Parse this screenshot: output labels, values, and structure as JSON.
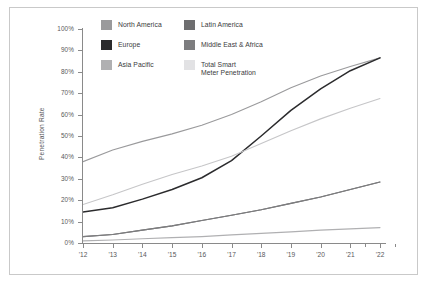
{
  "chart_data": {
    "type": "line",
    "title": "",
    "xlabel": "",
    "ylabel": "Penetration Rate",
    "categories": [
      "'12",
      "'13",
      "'14",
      "'15",
      "'16",
      "'17",
      "'18",
      "'19",
      "'20",
      "'21",
      "'22"
    ],
    "ylim": [
      0,
      100
    ],
    "ytick_labels": [
      "0%",
      "10%",
      "20%",
      "30%",
      "40%",
      "50%",
      "60%",
      "70%",
      "80%",
      "90%",
      "100%"
    ],
    "ytick_values": [
      0,
      10,
      20,
      30,
      40,
      50,
      60,
      70,
      80,
      90,
      100
    ],
    "grid": false,
    "legend_position": "top-left-inside",
    "series": [
      {
        "name": "North America",
        "color": "#9a9a9c",
        "values": [
          38,
          43.5,
          47.5,
          51,
          55,
          60,
          66,
          72.5,
          78,
          82.5,
          86.5
        ]
      },
      {
        "name": "Europe",
        "color": "#2b2b2d",
        "values": [
          14.5,
          16.5,
          20.5,
          25,
          30.5,
          38.5,
          50,
          62,
          72,
          80.5,
          86.5
        ]
      },
      {
        "name": "Asia Pacific",
        "color": "#b0b0b2",
        "values": [
          1,
          1.4,
          2,
          2.5,
          3,
          3.8,
          4.5,
          5.2,
          6,
          6.6,
          7.2
        ]
      },
      {
        "name": "Latin America",
        "color": "#6e6e70",
        "values": [
          3,
          4,
          6,
          8,
          10.5,
          13,
          15.5,
          18.5,
          21.5,
          25,
          28.5
        ]
      },
      {
        "name": "Middle East & Africa",
        "color": "#7d7d7f",
        "values": [
          3,
          4,
          6,
          8,
          10.5,
          13,
          15.5,
          18.5,
          21.5,
          25,
          28.5
        ]
      },
      {
        "name": "Total Smart\nMeter Penetration",
        "color": "#c6c6c8",
        "values": [
          18,
          22.5,
          27.5,
          32,
          36,
          40.5,
          46.5,
          52.5,
          58,
          63,
          67.5
        ]
      }
    ]
  },
  "legend": {
    "left_column": [
      {
        "label": "North America",
        "color": "#9a9a9c"
      },
      {
        "label": "Europe",
        "color": "#2b2b2d"
      },
      {
        "label": "Asia Pacific",
        "color": "#b0b0b2"
      }
    ],
    "right_column": [
      {
        "label": "Latin America",
        "color": "#6e6e70"
      },
      {
        "label": "Middle East & Africa",
        "color": "#7d7d7f"
      },
      {
        "label": "Total Smart\nMeter Penetration",
        "color": "#e2e2e4"
      }
    ]
  },
  "axes": {
    "y_title": "Penetration Rate"
  }
}
